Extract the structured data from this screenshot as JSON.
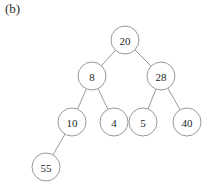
{
  "figure": {
    "label": "(b)",
    "caption_position": "top-left",
    "background_color": "#ffffff",
    "node_stroke_color": "#8d8d8d",
    "node_fill_color": "#ffffff",
    "edge_color": "#8d8d8d",
    "text_color": "#1f1f1f"
  },
  "diagram": {
    "type": "binary-tree",
    "node_radius": 14,
    "nodes": [
      {
        "id": "n20",
        "label": "20",
        "x": 125,
        "y": 40,
        "level": 0
      },
      {
        "id": "n8",
        "label": "8",
        "x": 92,
        "y": 76,
        "level": 1
      },
      {
        "id": "n28",
        "label": "28",
        "x": 161,
        "y": 76,
        "level": 1
      },
      {
        "id": "n10",
        "label": "10",
        "x": 72,
        "y": 122,
        "level": 2
      },
      {
        "id": "n4",
        "label": "4",
        "x": 114,
        "y": 122,
        "level": 2
      },
      {
        "id": "n5",
        "label": "5",
        "x": 143,
        "y": 122,
        "level": 2
      },
      {
        "id": "n40",
        "label": "40",
        "x": 187,
        "y": 122,
        "level": 2
      },
      {
        "id": "n55",
        "label": "55",
        "x": 46,
        "y": 167,
        "level": 3
      }
    ],
    "edges": [
      {
        "from": "n20",
        "to": "n8"
      },
      {
        "from": "n20",
        "to": "n28"
      },
      {
        "from": "n8",
        "to": "n10"
      },
      {
        "from": "n8",
        "to": "n4"
      },
      {
        "from": "n28",
        "to": "n5"
      },
      {
        "from": "n28",
        "to": "n40"
      },
      {
        "from": "n10",
        "to": "n55"
      }
    ]
  }
}
